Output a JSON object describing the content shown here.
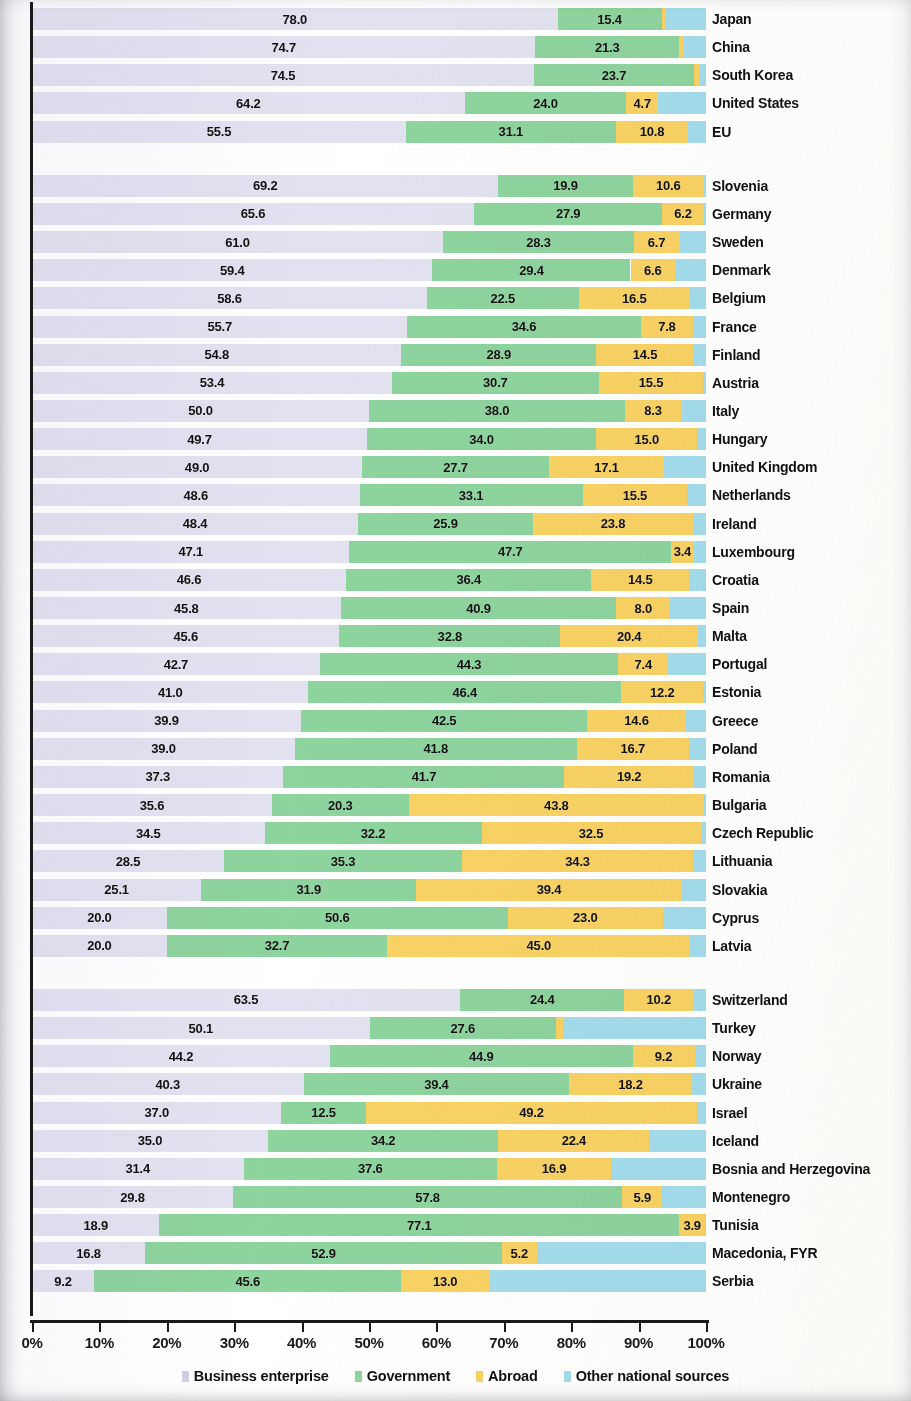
{
  "chart_data": {
    "type": "bar",
    "orientation": "horizontal",
    "stacked": true,
    "normalized": true,
    "title": "",
    "xlabel": "",
    "ylabel": "",
    "xlim": [
      0,
      100
    ],
    "grid": false,
    "legend_position": "bottom",
    "xticks": [
      "0%",
      "10%",
      "20%",
      "30%",
      "40%",
      "50%",
      "60%",
      "70%",
      "80%",
      "90%",
      "100%"
    ],
    "xtick_values": [
      0,
      10,
      20,
      30,
      40,
      50,
      60,
      70,
      80,
      90,
      100
    ],
    "series": [
      {
        "name": "Business enterprise",
        "color": "#e2e2f0"
      },
      {
        "name": "Government",
        "color": "#8ed49e"
      },
      {
        "name": "Abroad",
        "color": "#f9d264"
      },
      {
        "name": "Other national sources",
        "color": "#a3dced"
      }
    ],
    "categories": [
      "Japan",
      "China",
      "South Korea",
      "United States",
      "EU",
      "Slovenia",
      "Germany",
      "Sweden",
      "Denmark",
      "Belgium",
      "France",
      "Finland",
      "Austria",
      "Italy",
      "Hungary",
      "United Kingdom",
      "Netherlands",
      "Ireland",
      "Luxembourg",
      "Croatia",
      "Spain",
      "Malta",
      "Portugal",
      "Estonia",
      "Greece",
      "Poland",
      "Romania",
      "Bulgaria",
      "Czech Republic",
      "Lithuania",
      "Slovakia",
      "Cyprus",
      "Latvia",
      "Switzerland",
      "Turkey",
      "Norway",
      "Ukraine",
      "Israel",
      "Iceland",
      "Bosnia and Herzegovina",
      "Montenegro",
      "Tunisia",
      "Macedonia, FYR",
      "Serbia"
    ],
    "rows": [
      {
        "country": "Japan",
        "business_enterprise": 78.0,
        "government": 15.4,
        "abroad": 0.5,
        "other": 6.1,
        "group": 1
      },
      {
        "country": "China",
        "business_enterprise": 74.7,
        "government": 21.3,
        "abroad": 0.7,
        "other": 3.3,
        "group": 1
      },
      {
        "country": "South Korea",
        "business_enterprise": 74.5,
        "government": 23.7,
        "abroad": 0.8,
        "other": 1.0,
        "group": 1
      },
      {
        "country": "United States",
        "business_enterprise": 64.2,
        "government": 24.0,
        "abroad": 4.7,
        "other": 7.1,
        "group": 1
      },
      {
        "country": "EU",
        "business_enterprise": 55.5,
        "government": 31.1,
        "abroad": 10.8,
        "other": 2.6,
        "group": 1
      },
      {
        "country": "Slovenia",
        "business_enterprise": 69.2,
        "government": 19.9,
        "abroad": 10.6,
        "other": 0.3,
        "group": 2
      },
      {
        "country": "Germany",
        "business_enterprise": 65.6,
        "government": 27.9,
        "abroad": 6.2,
        "other": 0.3,
        "group": 2
      },
      {
        "country": "Sweden",
        "business_enterprise": 61.0,
        "government": 28.3,
        "abroad": 6.7,
        "other": 4.0,
        "group": 2
      },
      {
        "country": "Denmark",
        "business_enterprise": 59.4,
        "government": 29.4,
        "abroad": 6.6,
        "other": 4.6,
        "group": 2
      },
      {
        "country": "Belgium",
        "business_enterprise": 58.6,
        "government": 22.5,
        "abroad": 16.5,
        "other": 2.4,
        "group": 2
      },
      {
        "country": "France",
        "business_enterprise": 55.7,
        "government": 34.6,
        "abroad": 7.8,
        "other": 1.9,
        "group": 2
      },
      {
        "country": "Finland",
        "business_enterprise": 54.8,
        "government": 28.9,
        "abroad": 14.5,
        "other": 1.8,
        "group": 2
      },
      {
        "country": "Austria",
        "business_enterprise": 53.4,
        "government": 30.7,
        "abroad": 15.5,
        "other": 0.4,
        "group": 2
      },
      {
        "country": "Italy",
        "business_enterprise": 50.0,
        "government": 38.0,
        "abroad": 8.3,
        "other": 3.7,
        "group": 2
      },
      {
        "country": "Hungary",
        "business_enterprise": 49.7,
        "government": 34.0,
        "abroad": 15.0,
        "other": 1.3,
        "group": 2
      },
      {
        "country": "United Kingdom",
        "business_enterprise": 49.0,
        "government": 27.7,
        "abroad": 17.1,
        "other": 6.2,
        "group": 2
      },
      {
        "country": "Netherlands",
        "business_enterprise": 48.6,
        "government": 33.1,
        "abroad": 15.5,
        "other": 2.8,
        "group": 2
      },
      {
        "country": "Ireland",
        "business_enterprise": 48.4,
        "government": 25.9,
        "abroad": 23.8,
        "other": 1.9,
        "group": 2
      },
      {
        "country": "Luxembourg",
        "business_enterprise": 47.1,
        "government": 47.7,
        "abroad": 3.4,
        "other": 1.8,
        "group": 2
      },
      {
        "country": "Croatia",
        "business_enterprise": 46.6,
        "government": 36.4,
        "abroad": 14.5,
        "other": 2.5,
        "group": 2
      },
      {
        "country": "Spain",
        "business_enterprise": 45.8,
        "government": 40.9,
        "abroad": 8.0,
        "other": 5.3,
        "group": 2
      },
      {
        "country": "Malta",
        "business_enterprise": 45.6,
        "government": 32.8,
        "abroad": 20.4,
        "other": 1.2,
        "group": 2
      },
      {
        "country": "Portugal",
        "business_enterprise": 42.7,
        "government": 44.3,
        "abroad": 7.4,
        "other": 5.6,
        "group": 2
      },
      {
        "country": "Estonia",
        "business_enterprise": 41.0,
        "government": 46.4,
        "abroad": 12.2,
        "other": 0.4,
        "group": 2
      },
      {
        "country": "Greece",
        "business_enterprise": 39.9,
        "government": 42.5,
        "abroad": 14.6,
        "other": 3.0,
        "group": 2
      },
      {
        "country": "Poland",
        "business_enterprise": 39.0,
        "government": 41.8,
        "abroad": 16.7,
        "other": 2.5,
        "group": 2
      },
      {
        "country": "Romania",
        "business_enterprise": 37.3,
        "government": 41.7,
        "abroad": 19.2,
        "other": 1.8,
        "group": 2
      },
      {
        "country": "Bulgaria",
        "business_enterprise": 35.6,
        "government": 20.3,
        "abroad": 43.8,
        "other": 0.3,
        "group": 2
      },
      {
        "country": "Czech Republic",
        "business_enterprise": 34.5,
        "government": 32.2,
        "abroad": 32.5,
        "other": 0.8,
        "group": 2
      },
      {
        "country": "Lithuania",
        "business_enterprise": 28.5,
        "government": 35.3,
        "abroad": 34.3,
        "other": 1.9,
        "group": 2
      },
      {
        "country": "Slovakia",
        "business_enterprise": 25.1,
        "government": 31.9,
        "abroad": 39.4,
        "other": 3.6,
        "group": 2
      },
      {
        "country": "Cyprus",
        "business_enterprise": 20.0,
        "government": 50.6,
        "abroad": 23.0,
        "other": 6.4,
        "group": 2
      },
      {
        "country": "Latvia",
        "business_enterprise": 20.0,
        "government": 32.7,
        "abroad": 45.0,
        "other": 2.3,
        "group": 2
      },
      {
        "country": "Switzerland",
        "business_enterprise": 63.5,
        "government": 24.4,
        "abroad": 10.2,
        "other": 1.9,
        "group": 3
      },
      {
        "country": "Turkey",
        "business_enterprise": 50.1,
        "government": 27.6,
        "abroad": 1.1,
        "other": 21.2,
        "group": 3
      },
      {
        "country": "Norway",
        "business_enterprise": 44.2,
        "government": 44.9,
        "abroad": 9.2,
        "other": 1.7,
        "group": 3
      },
      {
        "country": "Ukraine",
        "business_enterprise": 40.3,
        "government": 39.4,
        "abroad": 18.2,
        "other": 2.1,
        "group": 3
      },
      {
        "country": "Israel",
        "business_enterprise": 37.0,
        "government": 12.5,
        "abroad": 49.2,
        "other": 1.3,
        "group": 3
      },
      {
        "country": "Iceland",
        "business_enterprise": 35.0,
        "government": 34.2,
        "abroad": 22.4,
        "other": 8.4,
        "group": 3
      },
      {
        "country": "Bosnia and Herzegovina",
        "business_enterprise": 31.4,
        "government": 37.6,
        "abroad": 16.9,
        "other": 14.1,
        "group": 3
      },
      {
        "country": "Montenegro",
        "business_enterprise": 29.8,
        "government": 57.8,
        "abroad": 5.9,
        "other": 6.5,
        "group": 3
      },
      {
        "country": "Tunisia",
        "business_enterprise": 18.9,
        "government": 77.1,
        "abroad": 3.9,
        "other": 0.1,
        "group": 3
      },
      {
        "country": "Macedonia, FYR",
        "business_enterprise": 16.8,
        "government": 52.9,
        "abroad": 5.2,
        "other": 25.1,
        "group": 3
      },
      {
        "country": "Serbia",
        "business_enterprise": 9.2,
        "government": 45.6,
        "abroad": 13.0,
        "other": 32.2,
        "group": 3
      }
    ],
    "label_visibility": {
      "note": "business_enterprise, government and abroad values are printed inside their segments; other-national-sources values are not printed",
      "show_business_enterprise": true,
      "show_government": true,
      "show_abroad": true,
      "show_other": false
    }
  },
  "legend": {
    "items": [
      {
        "label": "Business enterprise",
        "color": "#cfcfe8"
      },
      {
        "label": "Government",
        "color": "#8ed49e"
      },
      {
        "label": "Abroad",
        "color": "#f9d264"
      },
      {
        "label": "Other national sources",
        "color": "#a3dced"
      }
    ]
  }
}
